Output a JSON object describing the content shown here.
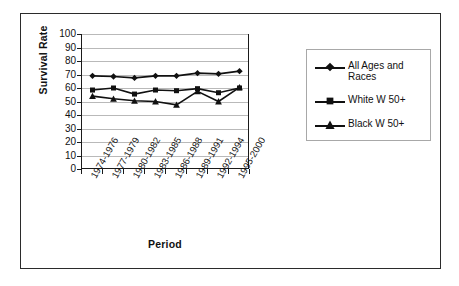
{
  "chart_data": {
    "type": "line",
    "title": "",
    "xlabel": "Period",
    "ylabel": "Survival Rate",
    "ylim": [
      0,
      100
    ],
    "ytick_step": 10,
    "yticks": [
      100,
      90,
      80,
      70,
      60,
      50,
      40,
      30,
      20,
      10,
      0
    ],
    "grid": true,
    "grid_axis": "y",
    "legend_position": "right",
    "categories": [
      "1974-1976",
      "1977-1979",
      "1980-1982",
      "1983-1985",
      "1986-1988",
      "1989-1991",
      "1992-1994",
      "1995-2000"
    ],
    "series": [
      {
        "name": "All Ages and Races",
        "marker": "diamond",
        "color": "#111111",
        "values": [
          69,
          68.5,
          67.5,
          69,
          69,
          71,
          70.5,
          72.5
        ]
      },
      {
        "name": "White W 50+",
        "marker": "square",
        "color": "#111111",
        "values": [
          58.5,
          60,
          55.5,
          58.5,
          58,
          59.5,
          56.5,
          60
        ]
      },
      {
        "name": "Black W 50+",
        "marker": "triangle",
        "color": "#111111",
        "values": [
          54,
          52,
          50.5,
          50,
          47.5,
          57.5,
          50,
          60.5
        ]
      }
    ]
  },
  "axes": {
    "y_title": "Survival Rate",
    "x_title": "Period"
  },
  "legend": {
    "entries": [
      {
        "label": "All Ages and Races",
        "marker": "diamond-marker"
      },
      {
        "label": "White W 50+",
        "marker": "square-marker"
      },
      {
        "label": "Black W 50+",
        "marker": "triangle-marker"
      }
    ]
  },
  "colors": {
    "ink": "#111111",
    "grid": "#b9b9b9",
    "frame": "#2b2b2b",
    "legend_border": "#a8a8a8",
    "background": "#ffffff"
  }
}
